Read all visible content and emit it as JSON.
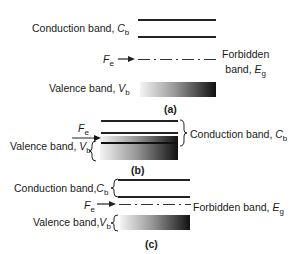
{
  "figure": {
    "panels": [
      {
        "caption": "(a)",
        "conduction_label": "Conduction band, ",
        "conduction_symbol": "C",
        "conduction_sub": "b",
        "fermi_symbol": "F",
        "fermi_sub": "e",
        "forbidden_label_line1": "Forbidden",
        "forbidden_label_line2": "band, ",
        "forbidden_symbol": "E",
        "forbidden_sub": "g",
        "valence_label": "Valence band, ",
        "valence_symbol": "V",
        "valence_sub": "b"
      },
      {
        "caption": "(b)",
        "fermi_symbol": "F",
        "fermi_sub": "e",
        "valence_label": "Valence band, ",
        "valence_symbol": "V",
        "valence_sub": "b",
        "conduction_label": "Conduction band, ",
        "conduction_symbol": "C",
        "conduction_sub": "b"
      },
      {
        "caption": "(c)",
        "conduction_label": "Conduction band,",
        "conduction_symbol": "C",
        "conduction_sub": "b",
        "fermi_symbol": "F",
        "fermi_sub": "e",
        "forbidden_label": "Forbidden band, ",
        "forbidden_symbol": "E",
        "forbidden_sub": "g",
        "valence_label": "Valence band,",
        "valence_symbol": "V",
        "valence_sub": "b"
      }
    ]
  }
}
